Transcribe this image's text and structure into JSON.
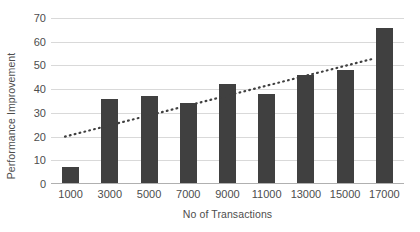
{
  "chart_data": {
    "type": "bar",
    "title": "",
    "xlabel": "No of Transactions",
    "ylabel": "Performance Improvement",
    "categories": [
      "1000",
      "3000",
      "5000",
      "7000",
      "9000",
      "11000",
      "13000",
      "15000",
      "17000"
    ],
    "values": [
      7,
      36,
      37,
      34,
      42,
      38,
      46,
      48,
      66
    ],
    "series": [
      {
        "name": "Performance Improvement",
        "type": "bar",
        "values": [
          7,
          36,
          37,
          34,
          42,
          38,
          46,
          48,
          66
        ],
        "color": "#404040"
      },
      {
        "name": "Linear trendline",
        "type": "line",
        "style": "dotted",
        "color": "#404040",
        "endpoints": [
          20,
          53
        ]
      }
    ],
    "ylim": [
      0,
      70
    ],
    "yticks": [
      0,
      10,
      20,
      30,
      40,
      50,
      60,
      70
    ],
    "ytick_labels": [
      "0",
      "10",
      "20",
      "30",
      "40",
      "50",
      "60",
      "70"
    ],
    "grid": true,
    "grid_axis": "y",
    "legend": false,
    "legend_position": "none",
    "background": "#ffffff",
    "gridline_color": "#d9d9d9",
    "text_color": "#4d4d4d"
  }
}
